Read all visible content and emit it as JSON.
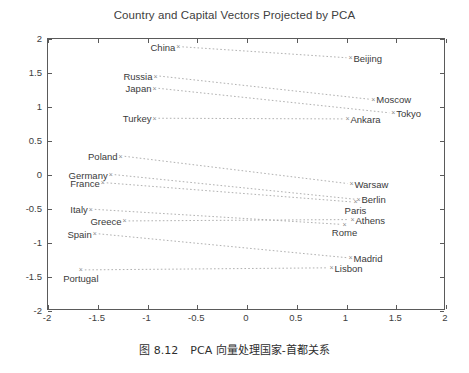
{
  "chart_data": {
    "type": "scatter",
    "title": "Country and Capital Vectors Projected by PCA",
    "xlabel": "",
    "ylabel": "",
    "xlim": [
      -2,
      2
    ],
    "ylim": [
      -2,
      2
    ],
    "grid": false,
    "legend": null,
    "xticks": [
      "-2",
      "-1.5",
      "-1",
      "-0.5",
      "0",
      "0.5",
      "1",
      "1.5",
      "2"
    ],
    "xtick_values": [
      -2,
      -1.5,
      -1,
      -0.5,
      0,
      0.5,
      1,
      1.5,
      2
    ],
    "yticks": [
      "2",
      "1.5",
      "1",
      "0.5",
      "0",
      "-0.5",
      "-1",
      "-1.5",
      "-2"
    ],
    "ytick_values": [
      2,
      1.5,
      1,
      0.5,
      0,
      -0.5,
      -1,
      -1.5,
      -2
    ],
    "marker": "x",
    "marker_color": "#8c8c8c",
    "line_style": "dotted",
    "line_color": "#a8a8a8",
    "pairs": [
      {
        "country": "China",
        "capital": "Beijing",
        "country_xy": [
          -0.68,
          1.87
        ],
        "capital_xy": [
          1.05,
          1.71
        ],
        "country_label_side": "left",
        "capital_label_side": "right"
      },
      {
        "country": "Russia",
        "capital": "Moscow",
        "country_xy": [
          -0.91,
          1.44
        ],
        "capital_xy": [
          1.28,
          1.1
        ],
        "country_label_side": "left",
        "capital_label_side": "right"
      },
      {
        "country": "Japan",
        "capital": "Tokyo",
        "country_xy": [
          -0.92,
          1.26
        ],
        "capital_xy": [
          1.48,
          0.9
        ],
        "country_label_side": "left",
        "capital_label_side": "right"
      },
      {
        "country": "Turkey",
        "capital": "Ankara",
        "country_xy": [
          -0.92,
          0.82
        ],
        "capital_xy": [
          1.02,
          0.81
        ],
        "country_label_side": "left",
        "capital_label_side": "right"
      },
      {
        "country": "Poland",
        "capital": "Warsaw",
        "country_xy": [
          -1.26,
          0.26
        ],
        "capital_xy": [
          1.06,
          -0.14
        ],
        "country_label_side": "left",
        "capital_label_side": "right"
      },
      {
        "country": "Germany",
        "capital": "Berlin",
        "country_xy": [
          -1.36,
          -0.01
        ],
        "capital_xy": [
          1.13,
          -0.37
        ],
        "country_label_side": "left",
        "capital_label_side": "right"
      },
      {
        "country": "France",
        "capital": "Paris",
        "country_xy": [
          -1.44,
          -0.13
        ],
        "capital_xy": [
          1.1,
          -0.41
        ],
        "country_label_side": "left",
        "capital_label_side": "below"
      },
      {
        "country": "Italy",
        "capital": "Rome",
        "country_xy": [
          -1.56,
          -0.52
        ],
        "capital_xy": [
          0.99,
          -0.74
        ],
        "country_label_side": "left",
        "capital_label_side": "below"
      },
      {
        "country": "Greece",
        "capital": "Athens",
        "country_xy": [
          -1.22,
          -0.69
        ],
        "capital_xy": [
          1.07,
          -0.67
        ],
        "country_label_side": "left",
        "capital_label_side": "right"
      },
      {
        "country": "Spain",
        "capital": "Madrid",
        "country_xy": [
          -1.52,
          -0.88
        ],
        "capital_xy": [
          1.05,
          -1.23
        ],
        "country_label_side": "left",
        "capital_label_side": "right"
      },
      {
        "country": "Portugal",
        "capital": "Lisbon",
        "country_xy": [
          -1.66,
          -1.41
        ],
        "capital_xy": [
          0.86,
          -1.38
        ],
        "country_label_side": "below",
        "capital_label_side": "right"
      }
    ]
  },
  "caption": {
    "figure_number": "图 8.12",
    "text": "PCA 向量处理国家-首都关系"
  }
}
